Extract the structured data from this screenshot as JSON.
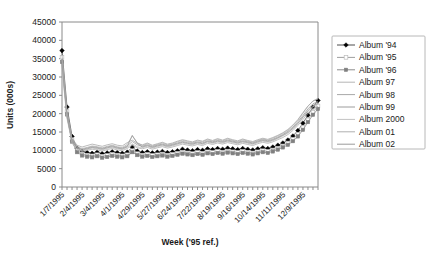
{
  "chart_data": {
    "type": "line",
    "title": "",
    "xlabel": "Week ('95 ref.)",
    "ylabel": "Units (000s)",
    "ylim": [
      0,
      45000
    ],
    "ytick_step": 5000,
    "yticks": [
      "0",
      "5000",
      "10000",
      "15000",
      "20000",
      "25000",
      "30000",
      "35000",
      "40000",
      "45000"
    ],
    "grid": false,
    "legend_position": "right",
    "x_count": 52,
    "xtick_labels": [
      "1/7/1995",
      "2/4/1995",
      "3/4/1995",
      "4/1/1995",
      "4/29/1995",
      "5/27/1995",
      "6/24/1995",
      "7/22/1995",
      "8/19/1995",
      "9/16/1995",
      "10/14/1995",
      "11/11/1995",
      "12/9/1995"
    ],
    "xtick_label_every": 4,
    "series": [
      {
        "name": "Album '94",
        "marker": "filled-diamond",
        "marker_color": "#000000",
        "color": "#4d4d4d",
        "values": [
          37200,
          21800,
          13800,
          10600,
          9700,
          9400,
          9200,
          9500,
          9100,
          9300,
          9600,
          9400,
          9200,
          9500,
          10900,
          9800,
          9400,
          9600,
          9300,
          9500,
          9700,
          9400,
          9600,
          9900,
          10300,
          10100,
          9900,
          10200,
          10000,
          10400,
          10200,
          10500,
          10300,
          10600,
          10400,
          10200,
          10500,
          10300,
          10100,
          10400,
          10700,
          10500,
          10900,
          11400,
          12000,
          12800,
          13900,
          15400,
          17400,
          19600,
          21800,
          23600
        ]
      },
      {
        "name": "Album '95",
        "marker": "open-square",
        "marker_color": "#bdbdbd",
        "color": "#9e9e9e",
        "values": [
          35400,
          20600,
          12900,
          9900,
          9000,
          8700,
          8500,
          8800,
          8400,
          8600,
          8900,
          8700,
          8500,
          8800,
          9900,
          9100,
          8700,
          8900,
          8600,
          8800,
          9000,
          8700,
          8900,
          9200,
          9500,
          9300,
          9100,
          9400,
          9200,
          9600,
          9400,
          9700,
          9500,
          9800,
          9600,
          9400,
          9700,
          9500,
          9300,
          9600,
          9900,
          9700,
          10100,
          10600,
          11200,
          12000,
          13000,
          14400,
          16200,
          18300,
          20400,
          22100
        ]
      },
      {
        "name": "Album '96",
        "marker": "filled-square",
        "marker_color": "#808080",
        "color": "#8c8c8c",
        "values": [
          34100,
          19800,
          12400,
          9500,
          8600,
          8300,
          8100,
          8400,
          8000,
          8200,
          8500,
          8300,
          8100,
          8400,
          9500,
          8700,
          8300,
          8500,
          8200,
          8400,
          8600,
          8300,
          8500,
          8800,
          9100,
          8900,
          8700,
          9000,
          8800,
          9200,
          9000,
          9300,
          9100,
          9400,
          9200,
          9000,
          9300,
          9100,
          8900,
          9200,
          9500,
          9300,
          9700,
          10200,
          10800,
          11500,
          12500,
          13800,
          15600,
          17700,
          19700,
          21300
        ]
      },
      {
        "name": "Album 97",
        "marker": "none",
        "marker_color": "#b5b5b5",
        "color": "#b5b5b5",
        "values": [
          33000,
          19000,
          12800,
          11000,
          10500,
          10800,
          11200,
          11000,
          10700,
          11100,
          11400,
          11000,
          10800,
          11600,
          13900,
          12100,
          11300,
          11800,
          11200,
          11600,
          12000,
          11500,
          11800,
          12300,
          12700,
          12400,
          12100,
          12600,
          12300,
          12900,
          12500,
          13000,
          12600,
          13100,
          12700,
          12400,
          12900,
          12500,
          12200,
          12700,
          13100,
          12800,
          13300,
          13900,
          14600,
          15500,
          16700,
          18200,
          20100,
          22000,
          23500,
          24200
        ]
      },
      {
        "name": "Album 98",
        "marker": "none",
        "marker_color": "#a8a8a8",
        "color": "#a8a8a8",
        "values": [
          36000,
          20400,
          13200,
          11400,
          10900,
          11300,
          11700,
          11400,
          11100,
          11500,
          11800,
          11400,
          11200,
          12100,
          12800,
          11900,
          11500,
          12000,
          11400,
          11800,
          12200,
          11700,
          12000,
          12500,
          12900,
          12600,
          12300,
          12800,
          12500,
          13100,
          12700,
          13200,
          12800,
          13300,
          12900,
          12600,
          13100,
          12700,
          12400,
          12900,
          13300,
          13000,
          13500,
          14100,
          14800,
          15700,
          16900,
          18400,
          20300,
          22100,
          23400,
          24000
        ]
      },
      {
        "name": "Album 99",
        "marker": "none",
        "marker_color": "#9c9c9c",
        "color": "#9c9c9c",
        "values": [
          35000,
          19600,
          12600,
          10800,
          10300,
          10600,
          11000,
          10800,
          10500,
          10900,
          11200,
          10800,
          10600,
          11200,
          12400,
          11500,
          11100,
          11500,
          11000,
          11400,
          11700,
          11300,
          11600,
          12000,
          12400,
          12100,
          11900,
          12300,
          12000,
          12600,
          12300,
          12700,
          12400,
          12800,
          12500,
          12200,
          12600,
          12300,
          12000,
          12500,
          12900,
          12600,
          13000,
          13600,
          14300,
          15200,
          16300,
          17800,
          19500,
          21300,
          22700,
          23300
        ]
      },
      {
        "name": "Album 2000",
        "marker": "none",
        "marker_color": "#c2c2c2",
        "color": "#c2c2c2",
        "values": [
          32000,
          18600,
          12200,
          10400,
          9900,
          10200,
          10600,
          10400,
          10100,
          10500,
          10800,
          10400,
          10200,
          10800,
          11800,
          11000,
          10700,
          11100,
          10600,
          11000,
          11300,
          10900,
          11200,
          11600,
          12000,
          11700,
          11500,
          11900,
          11600,
          12200,
          11900,
          12300,
          12000,
          12400,
          12100,
          11800,
          12200,
          11900,
          11600,
          12100,
          12500,
          12200,
          12600,
          13200,
          13900,
          14700,
          15800,
          17200,
          18900,
          20600,
          21900,
          22500
        ]
      },
      {
        "name": "Album 01",
        "marker": "none",
        "marker_color": "#b0b0b0",
        "color": "#b0b0b0",
        "values": [
          34500,
          19200,
          12000,
          10200,
          9700,
          10000,
          10300,
          10100,
          9800,
          10200,
          10500,
          10100,
          9900,
          10500,
          11400,
          10700,
          10400,
          10800,
          10300,
          10700,
          11000,
          10600,
          10900,
          11300,
          11700,
          11400,
          11200,
          11600,
          11300,
          11900,
          11600,
          12000,
          11700,
          12100,
          11800,
          11500,
          11900,
          11600,
          11300,
          11800,
          12200,
          11900,
          12300,
          12900,
          13500,
          14300,
          15400,
          16800,
          18400,
          20100,
          21400,
          22000
        ]
      },
      {
        "name": "Album 02",
        "marker": "none",
        "marker_color": "#9a9a9a",
        "color": "#9a9a9a",
        "values": [
          33500,
          19400,
          12500,
          10700,
          10100,
          10400,
          10800,
          10600,
          10300,
          10700,
          11000,
          10600,
          10400,
          11000,
          14100,
          11900,
          10900,
          11300,
          10800,
          11200,
          11500,
          11100,
          11400,
          11800,
          12200,
          11900,
          11700,
          12100,
          11800,
          12400,
          12100,
          12500,
          12200,
          12600,
          12300,
          12000,
          12400,
          12100,
          11800,
          12300,
          12700,
          12400,
          12800,
          13400,
          14100,
          14900,
          16000,
          17400,
          19100,
          20800,
          22200,
          22800
        ]
      }
    ]
  }
}
